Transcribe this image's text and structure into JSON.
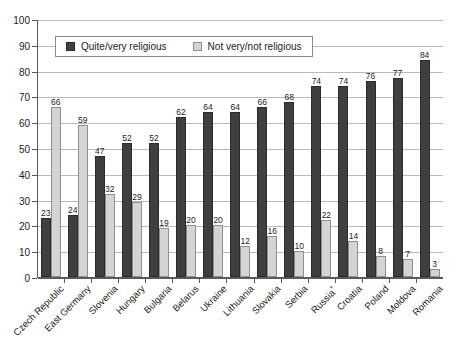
{
  "chart_data": {
    "type": "bar",
    "title": "",
    "subtitle": "",
    "xlabel": "",
    "ylabel": "",
    "ylim": [
      0,
      100
    ],
    "ytick_step": 10,
    "ytick_labels": [
      "0",
      "10",
      "20",
      "30",
      "40",
      "50",
      "60",
      "70",
      "80",
      "90",
      "100"
    ],
    "grid": true,
    "legend_position": "top-left-inside",
    "categories": [
      "Czech Republic",
      "East Germany",
      "Slovenia",
      "Hungary",
      "Bulgaria",
      "Belarus",
      "Ukraine",
      "Lithuania",
      "Slovakia",
      "Serbia",
      "Russia*",
      "Croatia",
      "Poland",
      "Moldova",
      "Romania"
    ],
    "category_footnote_marker": "*",
    "series": [
      {
        "name": "Quite/very religious",
        "color": "#3f3f3f",
        "values": [
          23,
          24,
          47,
          52,
          52,
          62,
          64,
          64,
          66,
          68,
          74,
          74,
          76,
          77,
          84
        ]
      },
      {
        "name": "Not very/not religious",
        "color": "#d4d4d4",
        "values": [
          66,
          59,
          32,
          29,
          19,
          20,
          20,
          12,
          16,
          10,
          22,
          14,
          8,
          7,
          3
        ]
      }
    ]
  },
  "legend": {
    "items": [
      {
        "label": "Quite/very religious",
        "swatch": "dark-square-icon"
      },
      {
        "label": "Not very/not religious",
        "swatch": "light-square-icon"
      }
    ]
  },
  "colors": {
    "series_dark": "#3f3f3f",
    "series_light": "#d4d4d4",
    "gridline": "#b9b9b9",
    "axis": "#5a5a5a",
    "background": "#ffffff",
    "text": "#1c1c1c"
  }
}
